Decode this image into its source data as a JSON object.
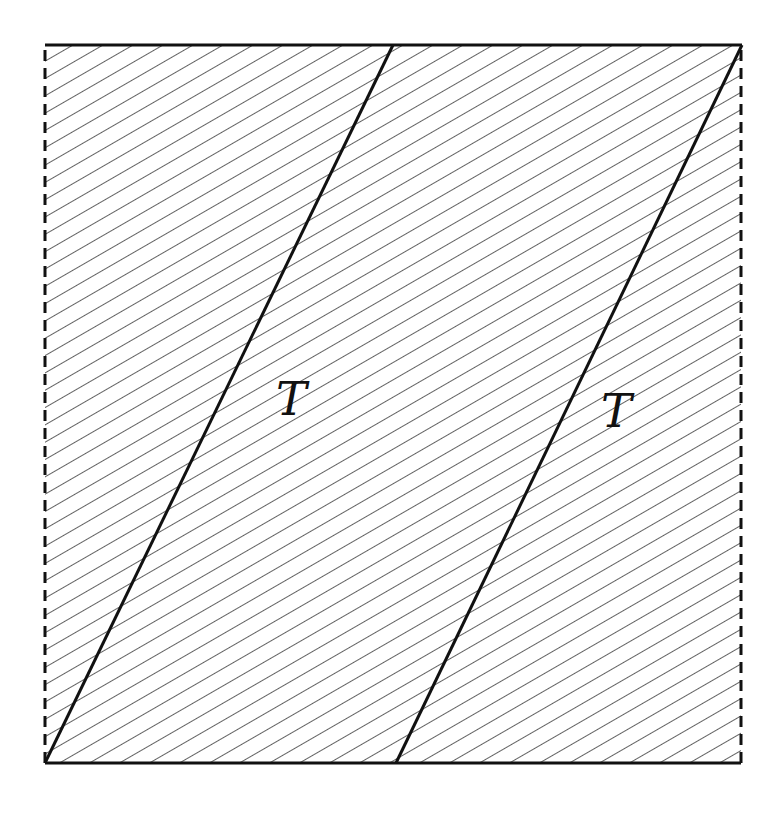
{
  "diagram": {
    "type": "torus-fundamental-domain-hatched",
    "square": {
      "x0": 45,
      "y0": 45,
      "x1": 741,
      "y1": 763,
      "top_edge": "solid",
      "bottom_edge": "solid",
      "left_edge": "dashed",
      "right_edge": "dashed"
    },
    "slanted_lines": [
      {
        "name": "slanted-line-1",
        "x1": 45,
        "y1": 763,
        "x2": 393,
        "y2": 45
      },
      {
        "name": "slanted-line-2",
        "x1": 396,
        "y1": 763,
        "x2": 742,
        "y2": 45
      }
    ],
    "hatch": {
      "angle_deg": -30,
      "spacing_px": 15,
      "color": "#333333"
    },
    "labels": [
      {
        "name": "label-T-left",
        "text": "T",
        "x": 276,
        "y": 415
      },
      {
        "name": "label-T-right",
        "text": "T",
        "x": 601,
        "y": 427
      }
    ],
    "colors": {
      "stroke": "#111111",
      "hatch": "#3a3a3a",
      "background": "#ffffff"
    }
  }
}
